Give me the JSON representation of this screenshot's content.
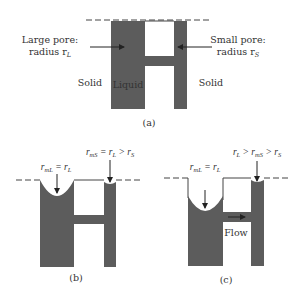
{
  "colors": {
    "liquid": "#5c5c5c",
    "line": "#444444",
    "text": "#333333",
    "background": "#ffffff"
  },
  "panel_a": {
    "caption": "(a)",
    "large_pore_label_1": "Large pore:",
    "large_pore_label_2": "radius r",
    "large_pore_sub": "L",
    "small_pore_label_1": "Small pore:",
    "small_pore_label_2": "radius r",
    "small_pore_sub": "S",
    "solid_left": "Solid",
    "solid_right": "Solid",
    "liquid": "Liquid"
  },
  "panel_b": {
    "caption": "(b)",
    "left_label": {
      "r": "r",
      "sub1": "mL",
      "eq": " = r",
      "sub2": "L"
    },
    "right_label": {
      "r": "r",
      "sub1": "mS",
      "eq": " = r",
      "sub2": "L",
      "gt": " > r",
      "sub3": "S"
    }
  },
  "panel_c": {
    "caption": "(c)",
    "flow": "Flow",
    "left_label": {
      "r": "r",
      "sub1": "mL",
      "eq": " = r",
      "sub2": "L"
    },
    "right_label": {
      "r": "r",
      "sub1": "L",
      "gt1": " > r",
      "sub2": "mS",
      "gt2": " > r",
      "sub3": "S"
    }
  }
}
